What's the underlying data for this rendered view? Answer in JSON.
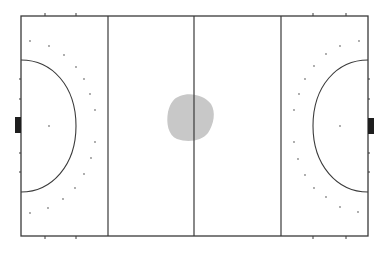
{
  "diagram": {
    "type": "field-hockey-pitch",
    "colors": {
      "background": "#ffffff",
      "lines": "#3a3a3a",
      "goals": "#1e1e1e",
      "dots": "#8a8a8a",
      "heat_blob": "#c8c8c8"
    },
    "pitch": {
      "left": 21,
      "top": 16,
      "right": 368,
      "bottom": 236
    },
    "lines_x": [
      108,
      194,
      281
    ],
    "heat_blob": {
      "label": "ball-position-heat-area",
      "center_x": 190,
      "center_y": 117
    }
  }
}
